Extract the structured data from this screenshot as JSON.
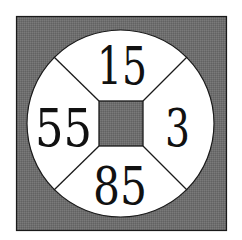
{
  "diagram": {
    "type": "circle-in-square number puzzle",
    "colors": {
      "background": "#ffffff",
      "shaded": "#6e6e6e",
      "circle_fill": "#ffffff",
      "stroke": "#1a1a1a",
      "text": "#111111"
    },
    "numbers": {
      "top": "15",
      "left": "55",
      "right": "3",
      "bottom": "85"
    },
    "shapes": {
      "outer_square": {
        "x": 16,
        "y": 16,
        "width": 211,
        "height": 215
      },
      "circle": {
        "cx": 120.5,
        "cy": 123.5,
        "r": 93.5
      },
      "inner_square": {
        "x": 99,
        "y": 101,
        "width": 44,
        "height": 45
      }
    }
  }
}
